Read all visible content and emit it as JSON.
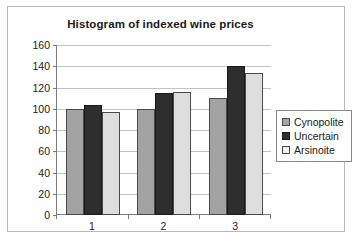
{
  "chart_data": {
    "type": "bar",
    "title": "Histogram of indexed wine prices",
    "xlabel": "",
    "ylabel": "",
    "categories": [
      "1",
      "2",
      "3"
    ],
    "series": [
      {
        "name": "Cynopolite",
        "color": "#a3a3a3",
        "values": [
          100,
          100,
          110
        ]
      },
      {
        "name": "Uncertain",
        "color": "#2e2e2e",
        "values": [
          104,
          115,
          140
        ]
      },
      {
        "name": "Arsinoite",
        "color": "#dedede",
        "values": [
          97,
          116,
          134
        ]
      }
    ],
    "ylim": [
      0,
      160
    ],
    "ytick_labels": [
      "0",
      "20",
      "40",
      "60",
      "80",
      "100",
      "120",
      "140",
      "160"
    ],
    "ytick_values": [
      0,
      20,
      40,
      60,
      80,
      100,
      120,
      140,
      160
    ],
    "grid": "horizontal",
    "legend_position": "right"
  }
}
